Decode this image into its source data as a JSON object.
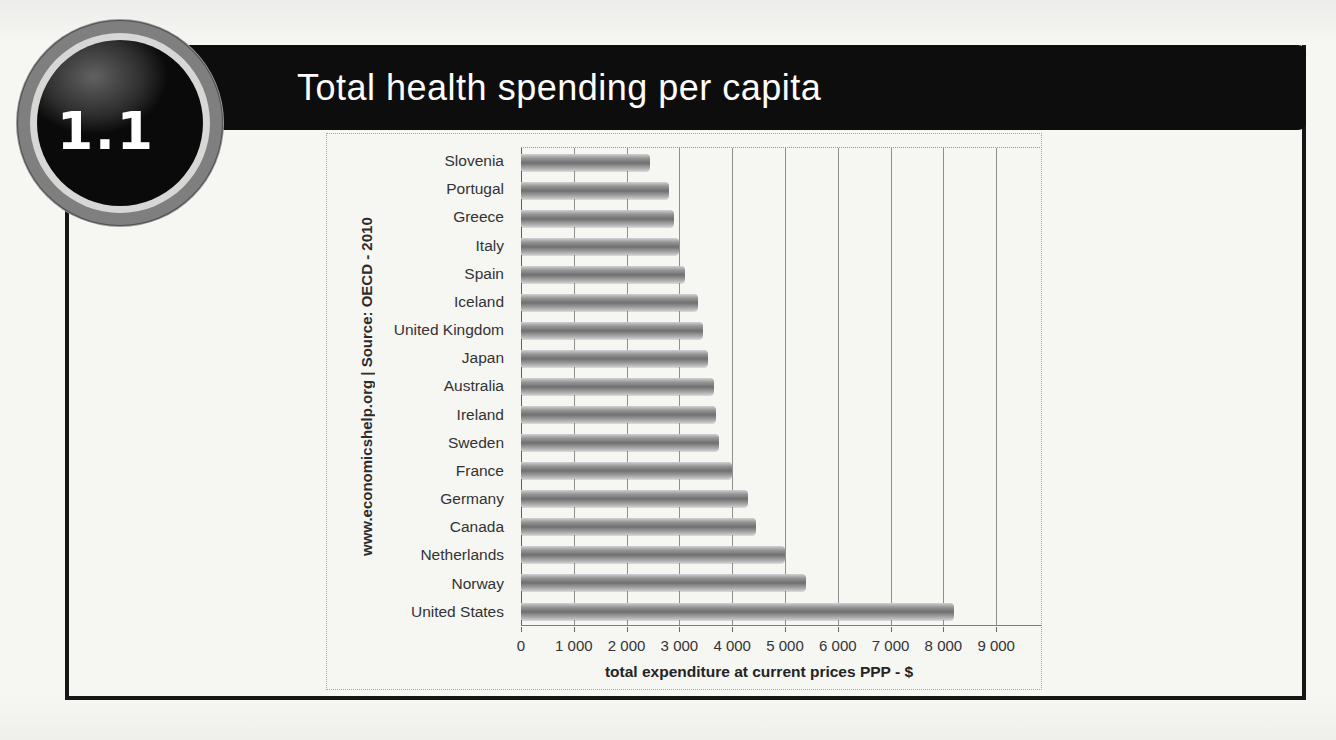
{
  "badge": {
    "label": "1.1"
  },
  "header": {
    "title": "Total health spending per capita"
  },
  "chart_data": {
    "type": "bar",
    "orientation": "horizontal",
    "title": "Total health spending per capita",
    "categories": [
      "Slovenia",
      "Portugal",
      "Greece",
      "Italy",
      "Spain",
      "Iceland",
      "United Kingdom",
      "Japan",
      "Australia",
      "Ireland",
      "Sweden",
      "France",
      "Germany",
      "Canada",
      "Netherlands",
      "Norway",
      "United States"
    ],
    "values": [
      2450,
      2800,
      2900,
      3000,
      3100,
      3350,
      3450,
      3550,
      3650,
      3700,
      3750,
      4000,
      4300,
      4450,
      5000,
      5400,
      8200
    ],
    "xlabel": "total expenditure at current prices PPP - $",
    "xlim": [
      0,
      9800
    ],
    "xticks": [
      0,
      1000,
      2000,
      3000,
      4000,
      5000,
      6000,
      7000,
      8000,
      9000
    ],
    "xtick_labels": [
      "0",
      "1 000",
      "2 000",
      "3 000",
      "4 000",
      "5 000",
      "6 000",
      "7 000",
      "8 000",
      "9 000"
    ],
    "source": "www.economicshelp.org | Source: OECD - 2010",
    "grid": true,
    "legend": "none",
    "bar_color_base": "#7a7a7a",
    "sorted": "ascending-from-top"
  }
}
